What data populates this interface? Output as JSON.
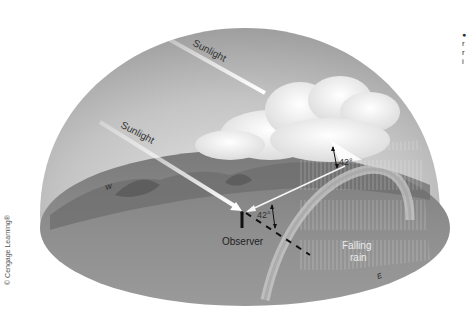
{
  "figure": {
    "labels": {
      "sunlight_upper": "Sunlight",
      "sunlight_lower": "Sunlight",
      "angle_upper": "42°",
      "angle_lower": "42°",
      "observer": "Observer",
      "falling_rain_line1": "Falling",
      "falling_rain_line2": "rain",
      "compass_west": "W",
      "compass_east": "E"
    },
    "credit": "© Cengage Learning®",
    "side_note_fragments": [
      "●",
      "r",
      "r",
      "i"
    ],
    "colors": {
      "sky_dome": "#b9b9b9",
      "ground": "#8a8a8a",
      "cloud": "#f4f4f4",
      "sunbeam": "#ffffff",
      "text_dark": "#333333",
      "text_light": "#ececec"
    }
  }
}
